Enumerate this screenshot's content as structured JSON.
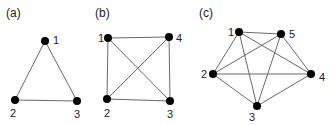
{
  "panels": [
    {
      "label": "(a)",
      "label_pos": [
        6,
        17
      ],
      "nodes": [
        {
          "id": "1",
          "x": 45,
          "y": 41,
          "lx": 53,
          "ly": 44
        },
        {
          "id": "2",
          "x": 15,
          "y": 100,
          "lx": 10,
          "ly": 117
        },
        {
          "id": "3",
          "x": 77,
          "y": 101,
          "lx": 74,
          "ly": 118
        }
      ],
      "edges": [
        [
          "1",
          "2"
        ],
        [
          "1",
          "3"
        ],
        [
          "2",
          "3"
        ]
      ]
    },
    {
      "label": "(b)",
      "label_pos": [
        95,
        17
      ],
      "nodes": [
        {
          "id": "1",
          "x": 108,
          "y": 38,
          "lx": 98,
          "ly": 42
        },
        {
          "id": "4",
          "x": 169,
          "y": 37,
          "lx": 176,
          "ly": 42
        },
        {
          "id": "2",
          "x": 107,
          "y": 99,
          "lx": 104,
          "ly": 117
        },
        {
          "id": "3",
          "x": 170,
          "y": 101,
          "lx": 167,
          "ly": 118
        }
      ],
      "edges": [
        [
          "1",
          "4"
        ],
        [
          "1",
          "2"
        ],
        [
          "1",
          "3"
        ],
        [
          "4",
          "2"
        ],
        [
          "4",
          "3"
        ],
        [
          "2",
          "3"
        ]
      ]
    },
    {
      "label": "(c)",
      "label_pos": [
        199,
        17
      ],
      "nodes": [
        {
          "id": "1",
          "x": 239,
          "y": 32,
          "lx": 228,
          "ly": 36
        },
        {
          "id": "5",
          "x": 281,
          "y": 34,
          "lx": 289,
          "ly": 38
        },
        {
          "id": "2",
          "x": 213,
          "y": 74,
          "lx": 201,
          "ly": 78
        },
        {
          "id": "4",
          "x": 311,
          "y": 74,
          "lx": 319,
          "ly": 81
        },
        {
          "id": "3",
          "x": 257,
          "y": 106,
          "lx": 249,
          "ly": 121
        }
      ],
      "edges": [
        [
          "1",
          "5"
        ],
        [
          "1",
          "2"
        ],
        [
          "1",
          "4"
        ],
        [
          "1",
          "3"
        ],
        [
          "5",
          "2"
        ],
        [
          "5",
          "4"
        ],
        [
          "5",
          "3"
        ],
        [
          "2",
          "4"
        ],
        [
          "2",
          "3"
        ],
        [
          "4",
          "3"
        ]
      ]
    }
  ]
}
